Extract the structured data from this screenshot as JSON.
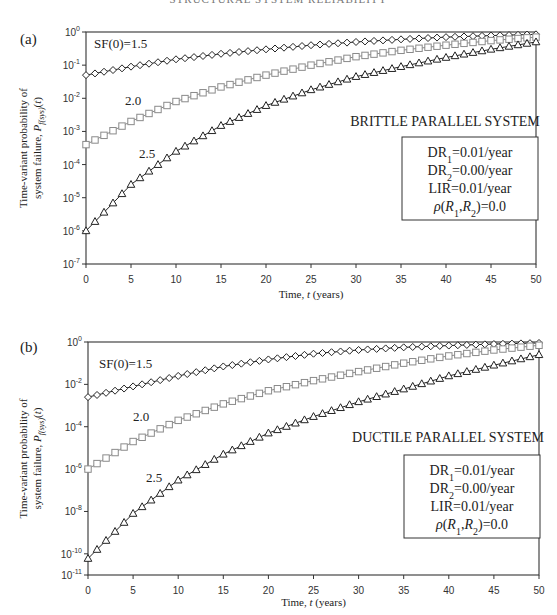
{
  "header": {
    "text": "STRUCTURAL SYSTEM RELIABILITY"
  },
  "colors": {
    "axis": "#333333",
    "series_dark": "#222222",
    "series_gray": "#8a8a8a"
  },
  "chart_data": [
    {
      "panel_label": "(a)",
      "type": "line",
      "title": "BRITTLE PARALLEL SYSTEM",
      "xlabel": "Time, t (years)",
      "ylabel_line1": "Time-variant probability of",
      "ylabel_line2": "system failure, P_f(sys)(t)",
      "yscale": "log",
      "xlim": [
        0,
        50
      ],
      "ylim_exp": [
        -7,
        0
      ],
      "xticks": [
        0,
        5,
        10,
        15,
        20,
        25,
        30,
        35,
        40,
        45,
        50
      ],
      "yticks_exp": [
        0,
        -1,
        -2,
        -3,
        -4,
        -5,
        -6,
        -7
      ],
      "x": [
        0,
        5,
        10,
        15,
        20,
        25,
        30,
        35,
        40,
        45,
        50
      ],
      "series": [
        {
          "name": "SF(0)=1.5",
          "label": "SF(0)=1.5",
          "marker": "diamond",
          "color": "#222222",
          "values": [
            0.05,
            0.09,
            0.15,
            0.22,
            0.3,
            0.4,
            0.5,
            0.6,
            0.7,
            0.78,
            0.85
          ]
        },
        {
          "name": "SF(0)=2.0",
          "label": "2.0",
          "marker": "square",
          "color": "#8a8a8a",
          "values": [
            0.0004,
            0.002,
            0.008,
            0.022,
            0.05,
            0.1,
            0.18,
            0.28,
            0.4,
            0.55,
            0.7
          ]
        },
        {
          "name": "SF(0)=2.5",
          "label": "2.5",
          "marker": "triangle",
          "color": "#222222",
          "values": [
            1e-06,
            2.5e-05,
            0.00025,
            0.0015,
            0.006,
            0.018,
            0.045,
            0.09,
            0.17,
            0.3,
            0.5
          ]
        }
      ],
      "legend_box": [
        "DR1=0.01/year",
        "DR2=0.00/year",
        "LIR=0.01/year",
        "ρ(R1,R2)=0.0"
      ]
    },
    {
      "panel_label": "(b)",
      "type": "line",
      "title": "DUCTILE PARALLEL SYSTEM",
      "xlabel": "Time, t (years)",
      "ylabel_line1": "Time-variant probability of",
      "ylabel_line2": "system failure, P_f(sys)(t)",
      "yscale": "log",
      "xlim": [
        0,
        50
      ],
      "ylim_exp": [
        -11,
        0
      ],
      "xticks": [
        0,
        5,
        10,
        15,
        20,
        25,
        30,
        35,
        40,
        45,
        50
      ],
      "yticks_exp": [
        0,
        -2,
        -4,
        -6,
        -8,
        -10,
        -11
      ],
      "x": [
        0,
        5,
        10,
        15,
        20,
        25,
        30,
        35,
        40,
        45,
        50
      ],
      "series": [
        {
          "name": "SF(0)=1.5",
          "label": "SF(0)=1.5",
          "marker": "diamond",
          "color": "#222222",
          "values": [
            0.0025,
            0.008,
            0.025,
            0.07,
            0.15,
            0.28,
            0.42,
            0.56,
            0.68,
            0.8,
            0.9
          ]
        },
        {
          "name": "SF(0)=2.0",
          "label": "2.0",
          "marker": "square",
          "color": "#8a8a8a",
          "values": [
            1e-06,
            2e-05,
            0.0002,
            0.0012,
            0.005,
            0.015,
            0.04,
            0.1,
            0.22,
            0.42,
            0.7
          ]
        },
        {
          "name": "SF(0)=2.5",
          "label": "2.5",
          "marker": "triangle",
          "color": "#222222",
          "values": [
            6e-11,
            8e-09,
            3e-07,
            5e-06,
            5e-05,
            0.0003,
            0.0015,
            0.006,
            0.025,
            0.08,
            0.25
          ]
        }
      ],
      "legend_box": [
        "DR1=0.01/year",
        "DR2=0.00/year",
        "LIR=0.01/year",
        "ρ(R1,R2)=0.0"
      ]
    }
  ]
}
